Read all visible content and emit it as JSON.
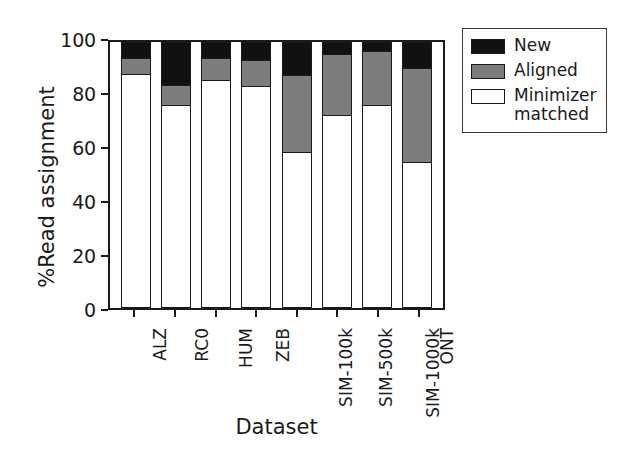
{
  "chart_data": {
    "type": "bar",
    "stacked": true,
    "title": "",
    "xlabel": "Dataset",
    "ylabel": "%Read assignment",
    "ylim": [
      0,
      100
    ],
    "yticks": [
      0,
      20,
      40,
      60,
      80,
      100
    ],
    "grid": false,
    "legend_position": "upper right (outside axes)",
    "categories": [
      "ALZ",
      "RC0",
      "HUM",
      "ZEB",
      "SIM-100k",
      "SIM-500k",
      "SIM-1000k",
      "ONT"
    ],
    "series": [
      {
        "name": "Minimizer matched",
        "color": "#ffffff",
        "values": [
          88.5,
          76.8,
          86.2,
          83.8,
          58.8,
          73.0,
          76.8,
          55.1
        ]
      },
      {
        "name": "Aligned",
        "color": "#7d7d7d",
        "values": [
          5.6,
          7.1,
          8.1,
          9.9,
          29.1,
          22.9,
          20.1,
          35.2
        ]
      },
      {
        "name": "New",
        "color": "#111111",
        "values": [
          5.9,
          16.1,
          5.7,
          6.3,
          12.1,
          4.1,
          3.1,
          9.7
        ]
      }
    ],
    "cumulative_tops": {
      "minimizer_matched": [
        88.5,
        76.8,
        86.2,
        83.8,
        58.8,
        73.0,
        76.8,
        55.1
      ],
      "aligned": [
        94.1,
        83.9,
        94.3,
        93.7,
        87.9,
        95.9,
        96.9,
        90.3
      ],
      "new": [
        100,
        100,
        100,
        100,
        100,
        100,
        100,
        100
      ]
    }
  },
  "axes": {
    "ylabel": "%Read assignment",
    "xlabel": "Dataset",
    "ytick_labels": [
      "100",
      "80",
      "60",
      "40",
      "20",
      "0"
    ],
    "xtick_labels": [
      "ALZ",
      "RC0",
      "HUM",
      "ZEB",
      "SIM-100k",
      "SIM-500k",
      "SIM-1000k",
      "ONT"
    ]
  },
  "legend": {
    "items": [
      {
        "label": "New",
        "swatch": "black"
      },
      {
        "label": "Aligned",
        "swatch": "gray"
      },
      {
        "label": "Minimizer\nmatched",
        "swatch": "white"
      }
    ]
  },
  "colors": {
    "new": "#111111",
    "aligned": "#7d7d7d",
    "minimizer_matched": "#ffffff",
    "axis": "#1a1a1a"
  }
}
